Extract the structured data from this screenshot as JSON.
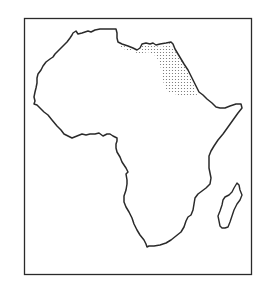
{
  "map": {
    "subject": "Africa outline map",
    "highlighted_region": "Northeast Africa (Libya/Egypt/Sudan desert region) stippled",
    "colors": {
      "background": "#ffffff",
      "outline": "#2a2a2a",
      "stipple": "#6a6a6a",
      "frame": "#2a2a2a"
    }
  }
}
